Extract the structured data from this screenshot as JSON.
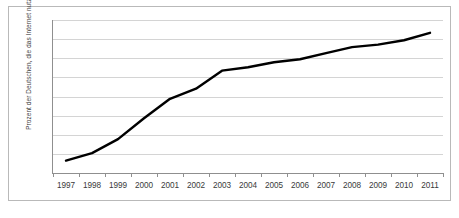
{
  "chart": {
    "title": "",
    "y_axis_title": "Prozent der Deutschen, die das Internet nutzen"
  },
  "chart_data": {
    "type": "line",
    "title": "",
    "xlabel": "",
    "ylabel": "Prozent der Deutschen, die das Internet nutzen",
    "categories": [
      "1997",
      "1998",
      "1999",
      "2000",
      "2001",
      "2002",
      "2003",
      "2004",
      "2005",
      "2006",
      "2007",
      "2008",
      "2009",
      "2010",
      "2011"
    ],
    "values": [
      6.5,
      10.4,
      17.7,
      28.6,
      38.8,
      44.1,
      53.5,
      55.3,
      57.9,
      59.5,
      62.7,
      65.8,
      67.1,
      69.4,
      73.3
    ],
    "series": [
      {
        "name": "Internetnutzer",
        "values": [
          6.5,
          10.4,
          17.7,
          28.6,
          38.8,
          44.1,
          53.5,
          55.3,
          57.9,
          59.5,
          62.7,
          65.8,
          67.1,
          69.4,
          73.3
        ],
        "color": "#000000"
      }
    ],
    "y_ticks": [
      0,
      10,
      20,
      30,
      40,
      50,
      60,
      70,
      80
    ],
    "ylim": [
      0,
      80
    ],
    "grid": true,
    "grid_color": "#d4d4d4",
    "legend": "none",
    "line_color": "#000000",
    "line_width": 2,
    "markers": false,
    "plot_background": "#ffffff",
    "border_color": "#b9b9b9"
  }
}
